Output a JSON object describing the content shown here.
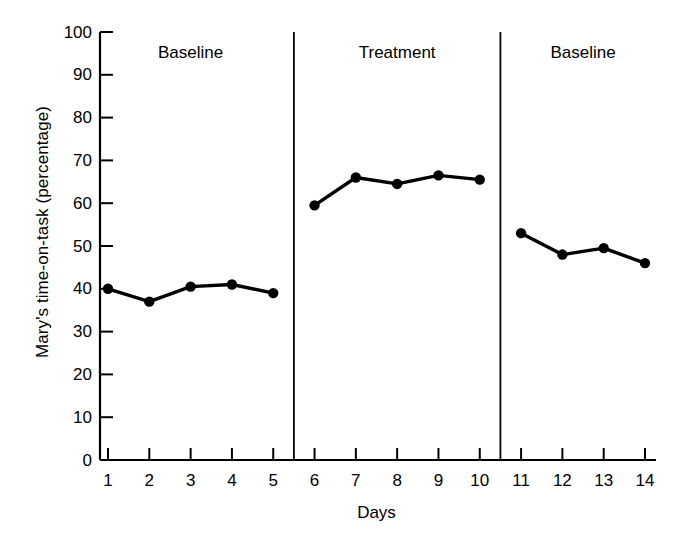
{
  "chart_data": {
    "type": "line",
    "title": "",
    "xlabel": "Days",
    "ylabel": "Mary's time-on-task (percentage)",
    "xlim": [
      1,
      14
    ],
    "ylim": [
      0,
      100
    ],
    "grid": false,
    "legend_position": "none",
    "x_tick_labels": [
      "1",
      "2",
      "3",
      "4",
      "5",
      "6",
      "7",
      "8",
      "9",
      "10",
      "11",
      "12",
      "13",
      "14"
    ],
    "y_tick_labels": [
      "0",
      "10",
      "20",
      "30",
      "40",
      "50",
      "60",
      "70",
      "80",
      "90",
      "100"
    ],
    "y_ticks": [
      0,
      10,
      20,
      30,
      40,
      50,
      60,
      70,
      80,
      90,
      100
    ],
    "marker": "filled-circle",
    "line_color": "#000000",
    "marker_color": "#000000",
    "phase_divider_color": "#000000",
    "phases": [
      {
        "label": "Baseline",
        "days": [
          1,
          2,
          3,
          4,
          5
        ]
      },
      {
        "label": "Treatment",
        "days": [
          6,
          7,
          8,
          9,
          10
        ]
      },
      {
        "label": "Baseline",
        "days": [
          11,
          12,
          13,
          14
        ]
      }
    ],
    "series": [
      {
        "name": "Mary's time-on-task",
        "segments": [
          {
            "phase": "Baseline",
            "x": [
              1,
              2,
              3,
              4,
              5
            ],
            "values": [
              40,
              37,
              40.5,
              41,
              39
            ]
          },
          {
            "phase": "Treatment",
            "x": [
              6,
              7,
              8,
              9,
              10
            ],
            "values": [
              59.5,
              66,
              64.5,
              66.5,
              65.5
            ]
          },
          {
            "phase": "Baseline",
            "x": [
              11,
              12,
              13,
              14
            ],
            "values": [
              53,
              48,
              49.5,
              46
            ]
          }
        ]
      }
    ],
    "x": [
      1,
      2,
      3,
      4,
      5,
      6,
      7,
      8,
      9,
      10,
      11,
      12,
      13,
      14
    ],
    "values": [
      40,
      37,
      40.5,
      41,
      39,
      59.5,
      66,
      64.5,
      66.5,
      65.5,
      53,
      48,
      49.5,
      46
    ]
  }
}
